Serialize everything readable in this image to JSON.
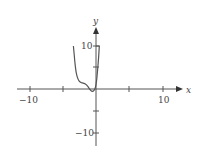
{
  "chart_data": {
    "type": "line",
    "title": "",
    "xlabel": "x",
    "ylabel": "y",
    "xlim": [
      -12,
      12.5
    ],
    "ylim": [
      -12.5,
      14
    ],
    "grid": false,
    "legend": null,
    "x_ticks": [
      -10,
      -5,
      0,
      5,
      10
    ],
    "x_tick_labels": [
      "-10",
      "",
      "",
      "",
      "10"
    ],
    "y_ticks": [
      -10,
      -5,
      5,
      10
    ],
    "y_tick_labels": [
      "-10",
      "",
      "",
      "10"
    ],
    "series": [
      {
        "name": "f(x)",
        "x": [
          -3.4,
          -3.2,
          -3.0,
          -2.7,
          -2.4,
          -2.0,
          -1.6,
          -1.2,
          -0.8,
          -0.5,
          -0.2,
          0.0,
          0.2,
          0.4,
          0.5
        ],
        "y": [
          10,
          6.5,
          3.8,
          2.2,
          1.6,
          1.4,
          1.2,
          0.6,
          -0.4,
          -0.6,
          -0.2,
          0.8,
          3.5,
          7.5,
          10
        ]
      }
    ],
    "annotations": []
  },
  "labels": {
    "x_axis": "x",
    "y_axis": "y",
    "x_neg10": "−10",
    "x_pos10": "10",
    "y_pos10": "10",
    "y_neg10": "−10"
  }
}
